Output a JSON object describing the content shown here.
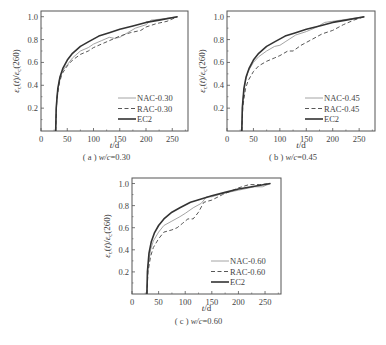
{
  "chart_data": [
    {
      "type": "line",
      "panel": "a",
      "caption_prefix": "( a )",
      "caption": "w/c=0.30",
      "xlabel": "t/d",
      "ylabel": "εc(t)/εc(260)",
      "xlim": [
        0,
        280
      ],
      "ylim": [
        0,
        1.05
      ],
      "xticks": [
        0,
        50,
        100,
        150,
        200,
        250
      ],
      "yticks": [
        0.2,
        0.4,
        0.6,
        0.8,
        1.0
      ],
      "legend_position": "lower right",
      "series": [
        {
          "name": "NAC-0.30",
          "style": "thin-solid",
          "x": [
            28,
            30,
            35,
            40,
            50,
            60,
            75,
            90,
            100,
            115,
            130,
            140,
            150,
            165,
            180,
            200,
            210,
            230,
            260
          ],
          "y": [
            0,
            0.3,
            0.45,
            0.52,
            0.58,
            0.64,
            0.7,
            0.73,
            0.76,
            0.79,
            0.82,
            0.81,
            0.82,
            0.86,
            0.9,
            0.93,
            0.97,
            0.98,
            1.0
          ]
        },
        {
          "name": "RAC-0.30",
          "style": "dashed",
          "x": [
            28,
            30,
            35,
            40,
            50,
            60,
            75,
            90,
            100,
            115,
            130,
            150,
            170,
            190,
            200,
            220,
            240,
            260
          ],
          "y": [
            0,
            0.28,
            0.42,
            0.5,
            0.57,
            0.62,
            0.67,
            0.7,
            0.73,
            0.76,
            0.79,
            0.83,
            0.86,
            0.88,
            0.91,
            0.94,
            0.96,
            1.0
          ]
        },
        {
          "name": "EC2",
          "style": "thick-solid",
          "x": [
            28,
            29,
            32,
            36,
            42,
            50,
            60,
            75,
            90,
            110,
            130,
            150,
            175,
            200,
            225,
            260
          ],
          "y": [
            0,
            0.2,
            0.37,
            0.47,
            0.55,
            0.62,
            0.68,
            0.74,
            0.78,
            0.83,
            0.86,
            0.89,
            0.92,
            0.95,
            0.97,
            1.0
          ]
        }
      ]
    },
    {
      "type": "line",
      "panel": "b",
      "caption_prefix": "( b )",
      "caption": "w/c=0.45",
      "xlabel": "t/d",
      "ylabel": "εc(t)/εc(260)",
      "xlim": [
        0,
        280
      ],
      "ylim": [
        0,
        1.05
      ],
      "xticks": [
        0,
        50,
        100,
        150,
        200,
        250
      ],
      "yticks": [
        0.2,
        0.4,
        0.6,
        0.8,
        1.0
      ],
      "legend_position": "lower right",
      "series": [
        {
          "name": "NAC-0.45",
          "style": "thin-solid",
          "x": [
            28,
            30,
            35,
            40,
            50,
            60,
            75,
            90,
            100,
            110,
            130,
            150,
            170,
            185,
            200,
            230,
            260
          ],
          "y": [
            0,
            0.28,
            0.44,
            0.52,
            0.6,
            0.65,
            0.7,
            0.74,
            0.75,
            0.78,
            0.84,
            0.87,
            0.91,
            0.95,
            0.96,
            0.98,
            1.0
          ]
        },
        {
          "name": "RAC-0.45",
          "style": "dashed",
          "x": [
            28,
            30,
            35,
            40,
            50,
            60,
            75,
            90,
            100,
            115,
            125,
            140,
            160,
            180,
            200,
            220,
            240,
            260
          ],
          "y": [
            0,
            0.22,
            0.37,
            0.44,
            0.52,
            0.57,
            0.61,
            0.64,
            0.66,
            0.7,
            0.7,
            0.75,
            0.8,
            0.85,
            0.88,
            0.93,
            0.97,
            1.0
          ]
        },
        {
          "name": "EC2",
          "style": "thick-solid",
          "x": [
            28,
            29,
            32,
            36,
            42,
            50,
            60,
            75,
            90,
            110,
            130,
            150,
            175,
            200,
            225,
            260
          ],
          "y": [
            0,
            0.2,
            0.37,
            0.47,
            0.55,
            0.62,
            0.68,
            0.74,
            0.78,
            0.83,
            0.86,
            0.89,
            0.92,
            0.95,
            0.97,
            1.0
          ]
        }
      ]
    },
    {
      "type": "line",
      "panel": "c",
      "caption_prefix": "( c )",
      "caption": "w/c=0.60",
      "xlabel": "t/d",
      "ylabel": "εc(t)/εc(260)",
      "xlim": [
        0,
        280
      ],
      "ylim": [
        0,
        1.05
      ],
      "xticks": [
        0,
        50,
        100,
        150,
        200,
        250
      ],
      "yticks": [
        0.2,
        0.4,
        0.6,
        0.8,
        1.0
      ],
      "legend_position": "lower right",
      "series": [
        {
          "name": "NAC-0.60",
          "style": "thin-solid",
          "x": [
            28,
            30,
            35,
            40,
            50,
            60,
            75,
            90,
            100,
            115,
            130,
            140,
            150,
            170,
            200,
            230,
            245,
            260
          ],
          "y": [
            0,
            0.25,
            0.4,
            0.48,
            0.56,
            0.62,
            0.66,
            0.7,
            0.73,
            0.78,
            0.82,
            0.88,
            0.88,
            0.91,
            0.94,
            0.97,
            0.97,
            1.0
          ]
        },
        {
          "name": "RAC-0.60",
          "style": "dashed",
          "x": [
            28,
            30,
            35,
            40,
            50,
            60,
            75,
            85,
            95,
            105,
            115,
            125,
            135,
            150,
            170,
            200,
            220,
            240,
            260
          ],
          "y": [
            0,
            0.2,
            0.34,
            0.42,
            0.5,
            0.56,
            0.58,
            0.6,
            0.64,
            0.68,
            0.68,
            0.74,
            0.83,
            0.85,
            0.9,
            0.96,
            0.99,
            0.99,
            1.0
          ]
        },
        {
          "name": "EC2",
          "style": "thick-solid",
          "x": [
            28,
            29,
            32,
            36,
            42,
            50,
            60,
            75,
            90,
            110,
            130,
            150,
            175,
            200,
            225,
            260
          ],
          "y": [
            0,
            0.2,
            0.37,
            0.47,
            0.55,
            0.62,
            0.68,
            0.74,
            0.78,
            0.83,
            0.86,
            0.89,
            0.92,
            0.95,
            0.97,
            1.0
          ]
        }
      ]
    }
  ],
  "layout": {
    "panels": [
      {
        "x0": 41,
        "y0": 11,
        "x1": 188,
        "y1": 131,
        "caption_y": 160,
        "xlabel_y": 148
      },
      {
        "x0": 227,
        "y0": 11,
        "x1": 375,
        "y1": 131,
        "caption_y": 160,
        "xlabel_y": 148
      },
      {
        "x0": 132,
        "y0": 178,
        "x1": 281,
        "y1": 294,
        "caption_y": 324,
        "xlabel_y": 311
      }
    ],
    "colors": {
      "thin": "#9a9a9a",
      "dashed": "#444444",
      "thick": "#333333",
      "frame": "#555555"
    }
  }
}
